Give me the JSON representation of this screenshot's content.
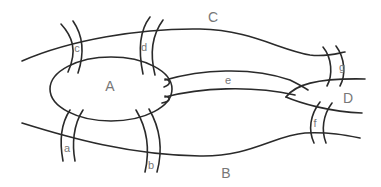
{
  "diagram": {
    "land_masses": [
      {
        "id": "A",
        "label": "A",
        "x": 110,
        "y": 91
      },
      {
        "id": "B",
        "label": "B",
        "x": 226,
        "y": 178
      },
      {
        "id": "C",
        "label": "C",
        "x": 213,
        "y": 22
      },
      {
        "id": "D",
        "label": "D",
        "x": 348,
        "y": 103
      }
    ],
    "bridges": [
      {
        "id": "a",
        "label": "a",
        "x": 66,
        "y": 152
      },
      {
        "id": "b",
        "label": "b",
        "x": 150,
        "y": 169
      },
      {
        "id": "c",
        "label": "c",
        "x": 76,
        "y": 52
      },
      {
        "id": "d",
        "label": "d",
        "x": 143,
        "y": 51
      },
      {
        "id": "e",
        "label": "e",
        "x": 228,
        "y": 84
      },
      {
        "id": "f",
        "label": "f",
        "x": 315,
        "y": 123
      },
      {
        "id": "g",
        "label": "g",
        "x": 342,
        "y": 71
      }
    ],
    "colors": {
      "line": "#2a2a2a",
      "label": "#777777",
      "background": "#ffffff"
    }
  }
}
